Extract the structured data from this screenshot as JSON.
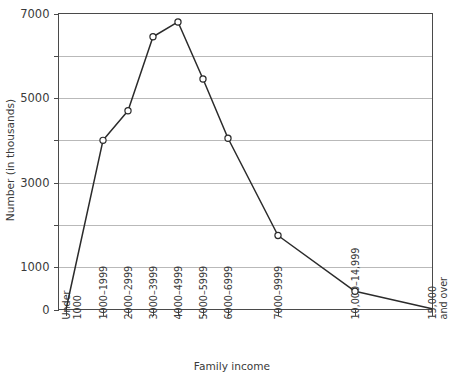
{
  "chart_data": {
    "type": "line",
    "title": "",
    "xlabel": "Family income",
    "ylabel": "Number (in thousands)",
    "categories": [
      "Under 1000",
      "1000–1999",
      "2000–2999",
      "3000–3999",
      "4000–4999",
      "5000–5999",
      "6000–6999",
      "7000–9999",
      "10,000–14,999",
      "15,000 and over"
    ],
    "category_lines": [
      [
        "Under",
        "1000"
      ],
      [
        "1000–1999"
      ],
      [
        "2000–2999"
      ],
      [
        "3000–3999"
      ],
      [
        "4000–4999"
      ],
      [
        "5000–5999"
      ],
      [
        "6000–6999"
      ],
      [
        "7000–9999"
      ],
      [
        "10,000–14,999"
      ],
      [
        "15,000",
        "and over"
      ]
    ],
    "values": [
      0,
      4000,
      4700,
      6450,
      6800,
      5450,
      4050,
      1750,
      430,
      20
    ],
    "series": [
      {
        "name": "Number of families",
        "values": [
          0,
          4000,
          4700,
          6450,
          6800,
          5450,
          4050,
          1750,
          430,
          20
        ]
      }
    ],
    "ylim": [
      0,
      7000
    ],
    "y_tick_values": [
      0,
      1000,
      2000,
      3000,
      4000,
      5000,
      6000,
      7000
    ],
    "y_labeled_ticks": [
      0,
      1000,
      3000,
      5000,
      7000
    ],
    "y_tick_labels": [
      "0",
      "1000",
      "3000",
      "5000",
      "7000"
    ],
    "grid": true,
    "grid_axis": "y",
    "legend": false,
    "legend_position": "none",
    "marker": "open-circle",
    "x_tick_pixels": [
      66,
      103,
      128,
      153,
      178,
      203,
      228,
      278,
      355,
      432
    ],
    "colors": {
      "line": "#2b2b2b",
      "marker_fill": "#ffffff",
      "grid": "#b9b9b9",
      "frame": "#4a4a4a",
      "text": "#3a3a3a",
      "background": "#ffffff"
    }
  }
}
